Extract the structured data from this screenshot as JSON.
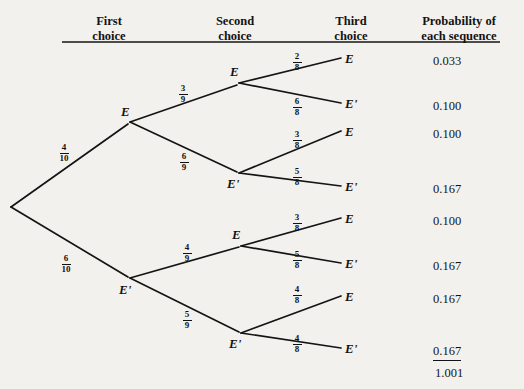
{
  "headers": [
    {
      "text": "First\nchoice",
      "x": 78,
      "y": 14,
      "w": 62
    },
    {
      "text": "Second\nchoice",
      "x": 198,
      "y": 14,
      "w": 74
    },
    {
      "text": "Third\nchoice",
      "x": 320,
      "y": 14,
      "w": 62
    },
    {
      "text": "Probability of\neach sequence",
      "x": 404,
      "y": 14,
      "w": 110
    }
  ],
  "rule": {
    "x1": 62,
    "x2": 500,
    "y": 42
  },
  "nodes": [
    {
      "name": "root",
      "x": 10,
      "y": 207,
      "label": ""
    },
    {
      "name": "first-E",
      "x": 130,
      "y": 122,
      "label": "E",
      "lx": 121,
      "ly": 104
    },
    {
      "name": "first-Enot",
      "x": 130,
      "y": 279,
      "label": "E'",
      "lx": 119,
      "ly": 282
    },
    {
      "name": "second-EE",
      "x": 238,
      "y": 83,
      "label": "E",
      "lx": 230,
      "ly": 64
    },
    {
      "name": "second-EEnot",
      "x": 238,
      "y": 173,
      "label": "E'",
      "lx": 227,
      "ly": 176
    },
    {
      "name": "second-EnotE",
      "x": 240,
      "y": 246,
      "label": "E",
      "lx": 232,
      "ly": 227
    },
    {
      "name": "second-EnotEnot",
      "x": 240,
      "y": 333,
      "label": "E'",
      "lx": 229,
      "ly": 336
    }
  ],
  "leaves": [
    {
      "name": "leaf-1",
      "x": 345,
      "y": 60,
      "label": "E"
    },
    {
      "name": "leaf-2",
      "x": 345,
      "y": 105,
      "label": "E'"
    },
    {
      "name": "leaf-3",
      "x": 345,
      "y": 133,
      "label": "E"
    },
    {
      "name": "leaf-4",
      "x": 345,
      "y": 188,
      "label": "E'"
    },
    {
      "name": "leaf-5",
      "x": 345,
      "y": 220,
      "label": "E"
    },
    {
      "name": "leaf-6",
      "x": 345,
      "y": 265,
      "label": "E'"
    },
    {
      "name": "leaf-7",
      "x": 345,
      "y": 298,
      "label": "E"
    },
    {
      "name": "leaf-8",
      "x": 345,
      "y": 350,
      "label": "E'"
    }
  ],
  "branch_fractions": [
    {
      "name": "frac-first-E",
      "num": "4",
      "den": "10",
      "x": 55,
      "y": 143
    },
    {
      "name": "frac-first-Enot",
      "num": "6",
      "den": "10",
      "x": 57,
      "y": 254
    },
    {
      "name": "frac-second-EE",
      "num": "3",
      "den": "9",
      "x": 174,
      "y": 84
    },
    {
      "name": "frac-second-EEnot",
      "num": "6",
      "den": "9",
      "x": 175,
      "y": 152
    },
    {
      "name": "frac-second-EnotE",
      "num": "4",
      "den": "9",
      "x": 178,
      "y": 243
    },
    {
      "name": "frac-second-EnotEnot",
      "num": "5",
      "den": "9",
      "x": 178,
      "y": 310
    },
    {
      "name": "frac-third-1",
      "num": "2",
      "den": "8",
      "x": 288,
      "y": 52
    },
    {
      "name": "frac-third-2",
      "num": "6",
      "den": "8",
      "x": 288,
      "y": 97
    },
    {
      "name": "frac-third-3",
      "num": "3",
      "den": "8",
      "x": 288,
      "y": 130
    },
    {
      "name": "frac-third-4",
      "num": "5",
      "den": "8",
      "x": 288,
      "y": 167
    },
    {
      "name": "frac-third-5",
      "num": "3",
      "den": "8",
      "x": 288,
      "y": 213
    },
    {
      "name": "frac-third-6",
      "num": "5",
      "den": "8",
      "x": 288,
      "y": 250
    },
    {
      "name": "frac-third-7",
      "num": "4",
      "den": "8",
      "x": 288,
      "y": 285
    },
    {
      "name": "frac-third-8",
      "num": "4",
      "den": "8",
      "x": 288,
      "y": 334
    }
  ],
  "probabilities": [
    {
      "name": "prob-1",
      "value": "0.033",
      "x": 433,
      "y": 54,
      "underlined": false
    },
    {
      "name": "prob-2",
      "value": "0.100",
      "x": 433,
      "y": 99,
      "underlined": false
    },
    {
      "name": "prob-3",
      "value": "0.100",
      "x": 433,
      "y": 127,
      "underlined": false
    },
    {
      "name": "prob-4",
      "value": "0.167",
      "x": 433,
      "y": 182,
      "underlined": false
    },
    {
      "name": "prob-5",
      "value": "0.100",
      "x": 433,
      "y": 214,
      "underlined": false
    },
    {
      "name": "prob-6",
      "value": "0.167",
      "x": 433,
      "y": 259,
      "underlined": false
    },
    {
      "name": "prob-7",
      "value": "0.167",
      "x": 433,
      "y": 292,
      "underlined": false
    },
    {
      "name": "prob-8",
      "value": "0.167",
      "x": 433,
      "y": 344,
      "underlined": true
    }
  ],
  "total": {
    "value": "1.001",
    "x": 435,
    "y": 366
  },
  "edges": [
    {
      "name": "edge-root-E",
      "x1": 11,
      "y1": 207,
      "x2": 128,
      "y2": 124
    },
    {
      "name": "edge-root-Enot",
      "x1": 11,
      "y1": 207,
      "x2": 128,
      "y2": 277
    },
    {
      "name": "edge-E-EE",
      "x1": 130,
      "y1": 122,
      "x2": 237,
      "y2": 85
    },
    {
      "name": "edge-E-EEnot",
      "x1": 130,
      "y1": 122,
      "x2": 237,
      "y2": 172
    },
    {
      "name": "edge-Enot-EnotE",
      "x1": 130,
      "y1": 278,
      "x2": 239,
      "y2": 247
    },
    {
      "name": "edge-Enot-EnotEnot",
      "x1": 130,
      "y1": 278,
      "x2": 239,
      "y2": 332
    },
    {
      "name": "edge-EE-leaf1",
      "x1": 239,
      "y1": 83,
      "x2": 341,
      "y2": 58
    },
    {
      "name": "edge-EE-leaf2",
      "x1": 239,
      "y1": 83,
      "x2": 341,
      "y2": 103
    },
    {
      "name": "edge-EEnot-leaf3",
      "x1": 239,
      "y1": 173,
      "x2": 341,
      "y2": 131
    },
    {
      "name": "edge-EEnot-leaf4",
      "x1": 239,
      "y1": 173,
      "x2": 341,
      "y2": 186
    },
    {
      "name": "edge-EnotE-leaf5",
      "x1": 241,
      "y1": 246,
      "x2": 341,
      "y2": 218
    },
    {
      "name": "edge-EnotE-leaf6",
      "x1": 241,
      "y1": 246,
      "x2": 341,
      "y2": 263
    },
    {
      "name": "edge-EnotEnot-leaf7",
      "x1": 241,
      "y1": 333,
      "x2": 341,
      "y2": 296
    },
    {
      "name": "edge-EnotEnot-leaf8",
      "x1": 241,
      "y1": 333,
      "x2": 341,
      "y2": 348
    }
  ],
  "colors": {
    "ink": "#141414",
    "paper": "#f3f1ed"
  }
}
